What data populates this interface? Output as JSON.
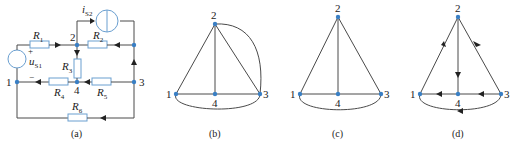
{
  "figures": [
    {
      "id": "a",
      "caption": "(a)",
      "type": "circuit",
      "nodes": [
        "1",
        "2",
        "3",
        "4"
      ],
      "components": [
        {
          "name": "R",
          "sub": "1",
          "between": [
            "1",
            "2"
          ]
        },
        {
          "name": "R",
          "sub": "2",
          "between": [
            "2",
            "3"
          ]
        },
        {
          "name": "R",
          "sub": "3",
          "between": [
            "2",
            "4"
          ]
        },
        {
          "name": "R",
          "sub": "4",
          "between": [
            "4",
            "1"
          ]
        },
        {
          "name": "R",
          "sub": "5",
          "between": [
            "3",
            "4"
          ]
        },
        {
          "name": "R",
          "sub": "6",
          "between": [
            "3",
            "1"
          ]
        },
        {
          "name": "u",
          "sub": "S1",
          "type": "voltage-source",
          "plus": "+",
          "minus": "−"
        },
        {
          "name": "i",
          "sub": "S2",
          "type": "current-source"
        }
      ]
    },
    {
      "id": "b",
      "caption": "(b)",
      "type": "graph",
      "nodes": [
        "1",
        "2",
        "3",
        "4"
      ]
    },
    {
      "id": "c",
      "caption": "(c)",
      "type": "graph",
      "nodes": [
        "1",
        "2",
        "3",
        "4"
      ]
    },
    {
      "id": "d",
      "caption": "(d)",
      "type": "directed-graph",
      "nodes": [
        "1",
        "2",
        "3",
        "4"
      ]
    }
  ],
  "colors": {
    "node": "#3a7fc4",
    "wire": "#4a4a4a",
    "component": "#6a9fd0"
  }
}
